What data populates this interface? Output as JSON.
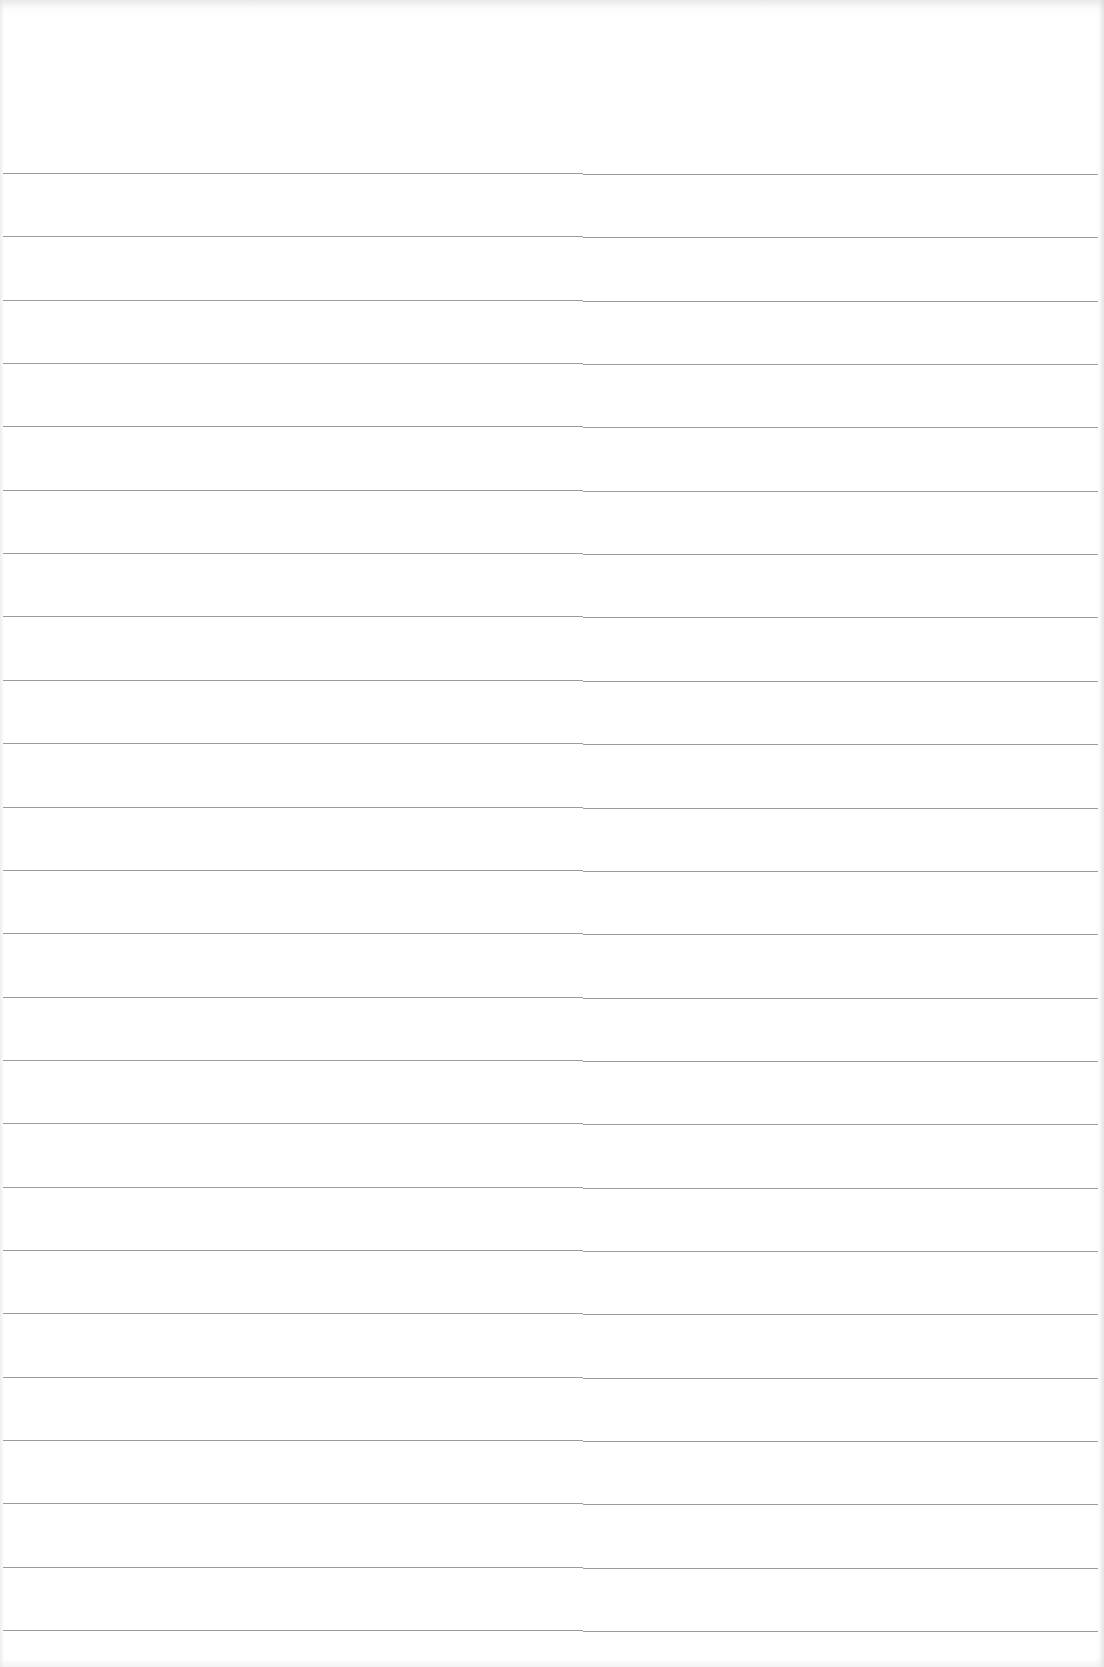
{
  "document": {
    "type": "ruled-paper",
    "text": "",
    "line_color": "#8a8a8a",
    "paper_color": "#ffffff",
    "rule_count": 24,
    "first_rule_y": 173,
    "rule_spacing": 63.35,
    "rules": [
      {
        "index": 1
      },
      {
        "index": 2
      },
      {
        "index": 3
      },
      {
        "index": 4
      },
      {
        "index": 5
      },
      {
        "index": 6
      },
      {
        "index": 7
      },
      {
        "index": 8
      },
      {
        "index": 9
      },
      {
        "index": 10
      },
      {
        "index": 11
      },
      {
        "index": 12
      },
      {
        "index": 13
      },
      {
        "index": 14
      },
      {
        "index": 15
      },
      {
        "index": 16
      },
      {
        "index": 17
      },
      {
        "index": 18
      },
      {
        "index": 19
      },
      {
        "index": 20
      },
      {
        "index": 21
      },
      {
        "index": 22
      },
      {
        "index": 23
      },
      {
        "index": 24
      }
    ]
  }
}
